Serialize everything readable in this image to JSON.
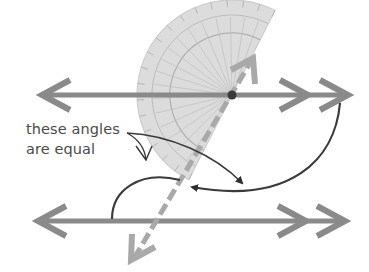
{
  "diagram": {
    "annotation": {
      "line1": "these angles",
      "line2": "are equal"
    },
    "elements": [
      {
        "name": "upper-parallel-line",
        "kind": "double-arrow line"
      },
      {
        "name": "lower-parallel-line",
        "kind": "double-arrow line"
      },
      {
        "name": "transversal",
        "kind": "dashed line with arrows"
      },
      {
        "name": "protractor",
        "kind": "semicircle protractor"
      },
      {
        "name": "angle-arc-upper",
        "kind": "angle arc"
      },
      {
        "name": "angle-arc-lower",
        "kind": "angle arc"
      }
    ],
    "colors": {
      "line": "#8a8a8a",
      "transversal": "#a9a9a9",
      "protractor_fill": "#d9d9d9",
      "protractor_stroke": "#b0b0b0",
      "arc": "#3a3a3a",
      "text": "#4a4a4a",
      "center_dot": "#3a3a3a"
    }
  }
}
